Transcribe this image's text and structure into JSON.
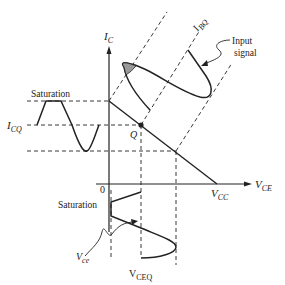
{
  "diagram": {
    "labels": {
      "y_axis": "I",
      "y_axis_sub": "C",
      "x_axis": "V",
      "x_axis_sub": "CE",
      "vcc": "V",
      "vcc_sub": "CC",
      "icq": "I",
      "icq_sub": "CQ",
      "ibq": "I",
      "ibq_sub": "BQ",
      "q_point": "Q",
      "origin": "0",
      "saturation_top": "Saturation",
      "saturation_bottom": "Saturation",
      "vce": "V",
      "vce_sub": "ce",
      "vceq": "V",
      "vceq_sub": "CEQ",
      "input_signal_line1": "Input",
      "input_signal_line2": "signal"
    },
    "colors": {
      "line": "#222222",
      "shaded": "#999999",
      "background": "#ffffff"
    }
  }
}
